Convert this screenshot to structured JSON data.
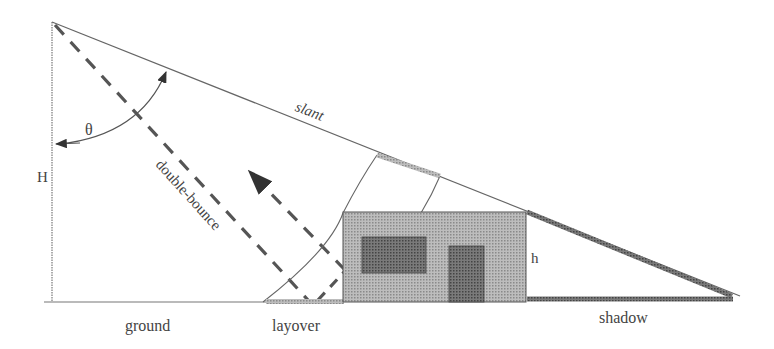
{
  "diagram": {
    "labels": {
      "slant": "slant",
      "theta": "θ",
      "H": "H",
      "double_bounce": "double-bounce",
      "h": "h",
      "ground": "ground",
      "layover": "layover",
      "shadow": "shadow"
    },
    "colors": {
      "line": "#555555",
      "dash": "#555555",
      "building": "#a8a8a8",
      "window": "#666666",
      "layover_band": "#b0b0b0",
      "shadow_band": "#444444"
    }
  }
}
